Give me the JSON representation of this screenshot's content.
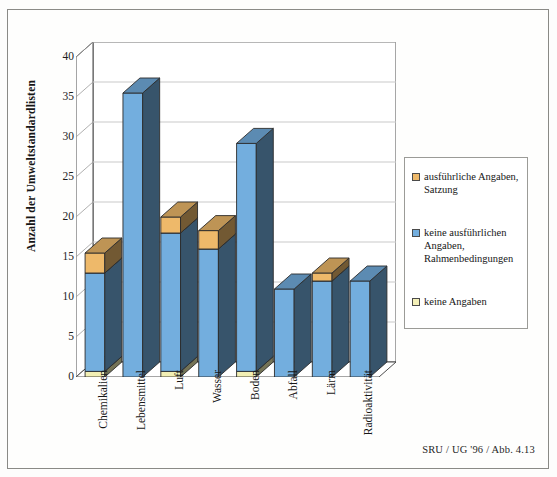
{
  "figure": {
    "caption": "SRU / UG '96 / Abb. 4.13"
  },
  "chart_data": {
    "type": "bar",
    "stacked": true,
    "projection": "3d",
    "title": "",
    "xlabel": "",
    "ylabel": "Anzahl der Umweltstandardlisten",
    "ylim": [
      0,
      40
    ],
    "yticks": [
      0,
      5,
      10,
      15,
      20,
      25,
      30,
      35,
      40
    ],
    "ytick_labels": [
      "0",
      "5",
      "10",
      "15",
      "20",
      "25",
      "30",
      "35",
      "40"
    ],
    "grid": true,
    "grid_axis": "y",
    "legend_position": "right",
    "categories": [
      "Chemikalien",
      "Lebensmittel",
      "Luft",
      "Wasser",
      "Boden",
      "Abfall",
      "Lärm",
      "Radioaktivität"
    ],
    "series": [
      {
        "name": "keine Angaben",
        "color": "#f2efb4",
        "values": [
          0.7,
          0,
          0.7,
          0,
          0.7,
          0,
          0,
          0
        ]
      },
      {
        "name": "keine ausführlichen Angaben, Rahmenbedingungen",
        "color": "#73aede",
        "values": [
          12.3,
          35.5,
          17.3,
          16.0,
          28.5,
          11.0,
          12.0,
          12.0
        ]
      },
      {
        "name": "ausführliche Angaben, Satzung",
        "color": "#eeb96a",
        "values": [
          2.5,
          0,
          2.0,
          2.3,
          0,
          0,
          1.0,
          0
        ]
      }
    ],
    "totals": [
      15.5,
      35.5,
      20.0,
      18.3,
      29.2,
      11.0,
      13.0,
      12.0
    ]
  },
  "legend": {
    "items": [
      {
        "label": "ausführliche Angaben, Satzung",
        "color": "#eeb96a"
      },
      {
        "label": "keine ausführlichen Angaben, Rahmenbedingungen",
        "color": "#73aede"
      },
      {
        "label": "keine Angaben",
        "color": "#f4f0b8"
      }
    ]
  }
}
